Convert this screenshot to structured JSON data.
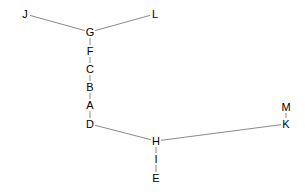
{
  "diagram": {
    "type": "tree",
    "nodes": [
      {
        "id": "J",
        "label": "J",
        "x": 25,
        "y": 14
      },
      {
        "id": "L",
        "label": "L",
        "x": 155,
        "y": 14
      },
      {
        "id": "G",
        "label": "G",
        "x": 90,
        "y": 32
      },
      {
        "id": "F",
        "label": "F",
        "x": 90,
        "y": 51
      },
      {
        "id": "C",
        "label": "C",
        "x": 90,
        "y": 69
      },
      {
        "id": "B",
        "label": "B",
        "x": 90,
        "y": 87
      },
      {
        "id": "A",
        "label": "A",
        "x": 90,
        "y": 105
      },
      {
        "id": "D",
        "label": "D",
        "x": 90,
        "y": 124
      },
      {
        "id": "H",
        "label": "H",
        "x": 156,
        "y": 141
      },
      {
        "id": "I",
        "label": "I",
        "x": 156,
        "y": 159
      },
      {
        "id": "E",
        "label": "E",
        "x": 156,
        "y": 178
      },
      {
        "id": "K",
        "label": "K",
        "x": 286,
        "y": 124
      },
      {
        "id": "M",
        "label": "M",
        "x": 286,
        "y": 107
      }
    ],
    "edges": [
      [
        "J",
        "G"
      ],
      [
        "L",
        "G"
      ],
      [
        "G",
        "F"
      ],
      [
        "F",
        "C"
      ],
      [
        "C",
        "B"
      ],
      [
        "B",
        "A"
      ],
      [
        "A",
        "D"
      ],
      [
        "D",
        "H"
      ],
      [
        "H",
        "I"
      ],
      [
        "I",
        "E"
      ],
      [
        "H",
        "K"
      ],
      [
        "K",
        "M"
      ]
    ]
  }
}
